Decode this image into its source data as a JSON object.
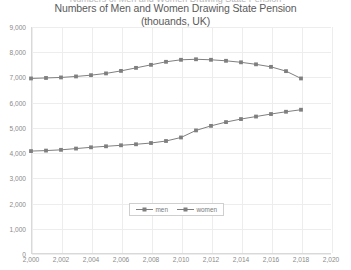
{
  "clipped_header_text": "Numbers of Men and Women Drawing State Pension",
  "chart_data": {
    "type": "line",
    "title_line1": "Numbers of Men and Women Drawing State Pension",
    "title_line2": "(thouands, UK)",
    "xlabel": "",
    "ylabel": "",
    "xlim": [
      2000,
      2020
    ],
    "ylim": [
      0,
      9000
    ],
    "ytick_step": 1000,
    "xtick_step": 2,
    "grid": true,
    "legend_position": "bottom-center",
    "marker": "square",
    "x": [
      2000,
      2001,
      2002,
      2003,
      2004,
      2005,
      2006,
      2007,
      2008,
      2009,
      2010,
      2011,
      2012,
      2013,
      2014,
      2015,
      2016,
      2017,
      2018
    ],
    "xticklabels": [
      "2,000",
      "2,002",
      "2,004",
      "2,006",
      "2,008",
      "2,010",
      "2,012",
      "2,014",
      "2,016",
      "2,018",
      "2,020"
    ],
    "yticklabels": [
      "0",
      "1,000",
      "2,000",
      "3,000",
      "4,000",
      "5,000",
      "6,000",
      "7,000",
      "8,000",
      "9,000"
    ],
    "series": [
      {
        "name": "men",
        "color": "#7f7f7f",
        "values": [
          4080,
          4100,
          4130,
          4180,
          4230,
          4270,
          4310,
          4350,
          4400,
          4480,
          4620,
          4900,
          5080,
          5230,
          5350,
          5450,
          5550,
          5640,
          5720
        ]
      },
      {
        "name": "women",
        "color": "#7f7f7f",
        "values": [
          6960,
          6980,
          7000,
          7040,
          7090,
          7160,
          7260,
          7380,
          7500,
          7620,
          7700,
          7720,
          7700,
          7660,
          7600,
          7520,
          7420,
          7250,
          6960
        ]
      }
    ]
  },
  "legend": {
    "items": [
      {
        "label": "men"
      },
      {
        "label": "women"
      }
    ]
  }
}
